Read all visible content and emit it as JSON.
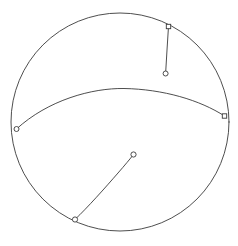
{
  "canvas": {
    "width": 238,
    "height": 246,
    "background_color": "#ffffff",
    "stroke_color": "#3a3a3a",
    "marker_fill_color": "#ffffff"
  },
  "figure": {
    "outline": {
      "name": "sphere-outline",
      "shape": "circle",
      "center_x": 120,
      "center_y": 122,
      "radius": 109,
      "stroke_width": 0.9
    },
    "arcs": [
      {
        "name": "arc-upper-right",
        "path": "M 168.5 26.5 C 167.6 42 166.4 58 165.6 73.5",
        "stroke_width": 0.9
      },
      {
        "name": "arc-equator",
        "path": "M 16.5 129 C 48 100 92 88 124 88.5 C 163 89.2 200 100 224.5 116",
        "stroke_width": 0.9
      },
      {
        "name": "arc-lower-left",
        "path": "M 75 219.5 C 88 207 105 188 118 173 C 125 165 130 159 133.5 154.5",
        "stroke_width": 0.9
      }
    ],
    "markers": [
      {
        "name": "marker-rim-top-right",
        "type": "square",
        "x": 168.5,
        "y": 26.5,
        "size": 4.4,
        "stroke_width": 0.9
      },
      {
        "name": "marker-endpoint-upper-right",
        "type": "circle",
        "x": 165.6,
        "y": 73.5,
        "radius": 2.5,
        "stroke_width": 0.9
      },
      {
        "name": "marker-rim-left",
        "type": "circle",
        "x": 16.5,
        "y": 129,
        "radius": 2.5,
        "stroke_width": 0.9
      },
      {
        "name": "marker-rim-right",
        "type": "square",
        "x": 224.5,
        "y": 116,
        "size": 4.4,
        "stroke_width": 0.9
      },
      {
        "name": "marker-rim-bottom-left",
        "type": "circle",
        "x": 75,
        "y": 219.5,
        "radius": 2.6,
        "stroke_width": 0.9
      },
      {
        "name": "marker-endpoint-interior",
        "type": "circle",
        "x": 133.5,
        "y": 154.5,
        "radius": 2.6,
        "stroke_width": 0.9
      }
    ]
  }
}
